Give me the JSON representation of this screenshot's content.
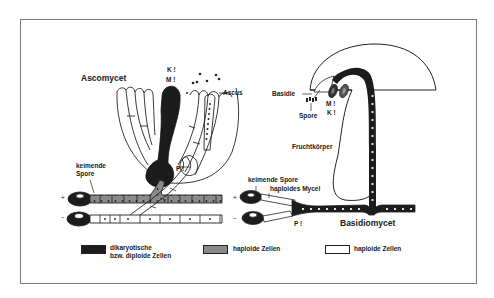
{
  "figure": {
    "ascomycete": {
      "title": "Ascomycet",
      "ascus_label": "Ascus",
      "karyogamy_label": "K !",
      "meiosis_label": "M !",
      "plasmogamy_label": "P !",
      "germinating_spore_label": [
        "keimende",
        "Spore"
      ],
      "plus_sign": "+",
      "minus_sign": "−"
    },
    "basidiomycete": {
      "title": "Basidiomycet",
      "basidium_label": "Basidie",
      "spore_label": "Spore",
      "meiosis_label": "M !",
      "karyogamy_label": "K !",
      "fruiting_body_label": "Fruchtkörper",
      "germinating_spore_label": "keimende Spore",
      "haploid_mycelium_label": "haploides Mycel",
      "plasmogamy_label": "P !",
      "plus_sign": "+",
      "minus_sign": "−"
    },
    "legend": [
      {
        "swatch": "dark",
        "color": "#1c1c1c",
        "lines": [
          "dikaryotische",
          "bzw. diploide Zellen"
        ]
      },
      {
        "swatch": "gray",
        "color": "#8a8a8a",
        "lines": [
          "haploide Zellen"
        ]
      },
      {
        "swatch": "white",
        "color": "#ffffff",
        "lines": [
          "haploide Zellen"
        ]
      }
    ]
  }
}
